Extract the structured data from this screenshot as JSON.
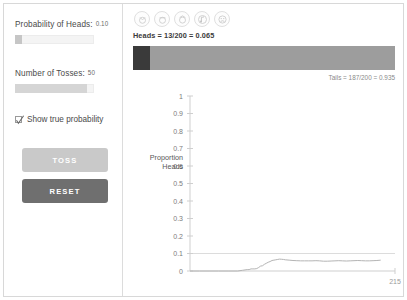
{
  "controls": {
    "probability_label": "Probability of Heads:",
    "probability_value": "0.10",
    "tosses_label": "Number of Tosses:",
    "tosses_value": "50",
    "show_true_probability_label": "Show true probability",
    "show_true_probability_checked": true,
    "toss_button_label": "TOSS",
    "reset_button_label": "RESET"
  },
  "toolbar": {
    "icons": [
      "slow-speed-icon",
      "medium-speed-icon",
      "fast-speed-icon",
      "sound-icon",
      "settings-icon"
    ]
  },
  "readout": {
    "heads_text": "Heads = 13/200 = 0.065",
    "tails_text": "Tails = 187/200 = 0.935",
    "heads_count": 13,
    "tails_count": 187,
    "total_tosses": 200,
    "heads_proportion": 0.065,
    "tails_proportion": 0.935
  },
  "colors": {
    "heads_segment": "#3a3a3a",
    "tails_segment": "#9d9d9d",
    "toss_button": "#c9c9c9",
    "reset_button": "#6f6f6f",
    "axis": "#cfcfcf",
    "trace": "#b4b4b4",
    "true_probability_line": "#dcdcdc"
  },
  "chart_data": {
    "type": "line",
    "title": "",
    "xlabel": "",
    "ylabel": "Proportion Heads",
    "ylim": [
      0,
      1
    ],
    "xlim": [
      0,
      215
    ],
    "grid": false,
    "legend": null,
    "ytick_labels": [
      "1",
      "0.9",
      "0.8",
      "0.7",
      "0.6",
      "0.5",
      "0.4",
      "0.3",
      "0.2",
      "0.1",
      "0"
    ],
    "ytick_values": [
      1,
      0.9,
      0.8,
      0.7,
      0.6,
      0.5,
      0.4,
      0.3,
      0.2,
      0.1,
      0
    ],
    "xtick_labels": [
      "215"
    ],
    "xtick_values": [
      215
    ],
    "annotations": [
      {
        "name": "true-probability-line",
        "y": 0.1,
        "style": "horizontal-line"
      }
    ],
    "series": [
      {
        "name": "Proportion Heads",
        "x": [
          0,
          10,
          20,
          30,
          40,
          50,
          55,
          60,
          62,
          64,
          66,
          68,
          70,
          72,
          74,
          76,
          78,
          80,
          82,
          84,
          86,
          88,
          90,
          92,
          94,
          96,
          98,
          100,
          104,
          108,
          112,
          116,
          120,
          124,
          128,
          132,
          136,
          140,
          144,
          148,
          152,
          156,
          160,
          164,
          168,
          172,
          176,
          180,
          184,
          188,
          192,
          196,
          200
        ],
        "y": [
          0,
          0,
          0,
          0,
          0,
          0,
          0.004,
          0.008,
          0.008,
          0.012,
          0.012,
          0.012,
          0.014,
          0.02,
          0.028,
          0.03,
          0.038,
          0.044,
          0.05,
          0.054,
          0.06,
          0.062,
          0.064,
          0.066,
          0.068,
          0.067,
          0.066,
          0.064,
          0.062,
          0.06,
          0.059,
          0.058,
          0.058,
          0.058,
          0.058,
          0.059,
          0.058,
          0.056,
          0.056,
          0.057,
          0.058,
          0.059,
          0.058,
          0.057,
          0.058,
          0.059,
          0.06,
          0.059,
          0.058,
          0.058,
          0.059,
          0.06,
          0.062
        ]
      }
    ]
  }
}
